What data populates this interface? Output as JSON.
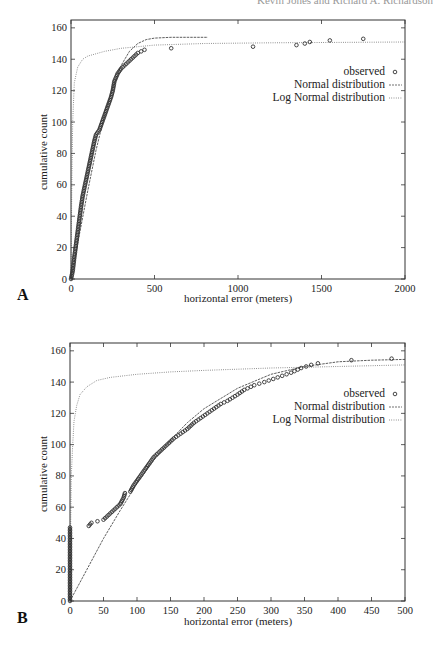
{
  "header": {
    "running_head": "Kevin Jones and Richard A. Richardson"
  },
  "chart_data": [
    {
      "panel": "A",
      "type": "scatter",
      "title": "",
      "xlabel": "horizontal error (meters)",
      "ylabel": "cumulative count",
      "xlim": [
        0,
        2000
      ],
      "ylim": [
        0,
        165
      ],
      "xticks": [
        0,
        500,
        1000,
        1500,
        2000
      ],
      "yticks": [
        0,
        20,
        40,
        60,
        80,
        100,
        120,
        140,
        160
      ],
      "grid": false,
      "legend_position": "upper right",
      "legend": [
        "observed",
        "Normal distribution",
        "Log Normal distribution"
      ],
      "series": [
        {
          "name": "observed",
          "style": "open circles",
          "points": [
            [
              0,
              0
            ],
            [
              10,
              5
            ],
            [
              20,
              14
            ],
            [
              30,
              22
            ],
            [
              40,
              30
            ],
            [
              50,
              38
            ],
            [
              60,
              46
            ],
            [
              70,
              53
            ],
            [
              80,
              58
            ],
            [
              90,
              63
            ],
            [
              100,
              68
            ],
            [
              110,
              73
            ],
            [
              120,
              78
            ],
            [
              130,
              83
            ],
            [
              140,
              88
            ],
            [
              150,
              92
            ],
            [
              170,
              95
            ],
            [
              180,
              98
            ],
            [
              200,
              104
            ],
            [
              220,
              110
            ],
            [
              240,
              116
            ],
            [
              250,
              120
            ],
            [
              260,
              126
            ],
            [
              280,
              131
            ],
            [
              300,
              134
            ],
            [
              320,
              136
            ],
            [
              350,
              139
            ],
            [
              380,
              142
            ],
            [
              400,
              144
            ],
            [
              420,
              145
            ],
            [
              440,
              146
            ],
            [
              600,
              147
            ],
            [
              1090,
              148
            ],
            [
              1350,
              149
            ],
            [
              1400,
              150
            ],
            [
              1430,
              151
            ],
            [
              1550,
              152
            ],
            [
              1750,
              153
            ]
          ]
        },
        {
          "name": "Normal distribution",
          "style": "dashed line",
          "points": [
            [
              0,
              0
            ],
            [
              50,
              28
            ],
            [
              100,
              56
            ],
            [
              150,
              82
            ],
            [
              200,
              104
            ],
            [
              250,
              122
            ],
            [
              300,
              136
            ],
            [
              350,
              145
            ],
            [
              400,
              150
            ],
            [
              450,
              152.5
            ],
            [
              500,
              153.5
            ],
            [
              600,
              154
            ],
            [
              700,
              154
            ],
            [
              820,
              154
            ]
          ]
        },
        {
          "name": "Log Normal distribution",
          "style": "dotted line",
          "points": [
            [
              0,
              0
            ],
            [
              5,
              60
            ],
            [
              10,
              100
            ],
            [
              20,
              125
            ],
            [
              40,
              135
            ],
            [
              70,
              140
            ],
            [
              100,
              142
            ],
            [
              200,
              145
            ],
            [
              300,
              147
            ],
            [
              500,
              149
            ],
            [
              800,
              150
            ],
            [
              1200,
              150.5
            ],
            [
              2000,
              151
            ]
          ]
        }
      ]
    },
    {
      "panel": "B",
      "type": "scatter",
      "title": "",
      "xlabel": "horizontal error (meters)",
      "ylabel": "cumulative count",
      "xlim": [
        0,
        500
      ],
      "ylim": [
        0,
        165
      ],
      "xticks": [
        0,
        50,
        100,
        150,
        200,
        250,
        300,
        350,
        400,
        450,
        500
      ],
      "yticks": [
        0,
        20,
        40,
        60,
        80,
        100,
        120,
        140,
        160
      ],
      "grid": false,
      "legend_position": "upper right",
      "legend": [
        "observed",
        "Normal distribution",
        "Log Normal distribution"
      ],
      "series": [
        {
          "name": "observed",
          "style": "open circles",
          "points": [
            [
              0,
              0
            ],
            [
              0,
              5
            ],
            [
              0,
              10
            ],
            [
              0,
              15
            ],
            [
              0,
              20
            ],
            [
              0,
              25
            ],
            [
              0,
              30
            ],
            [
              0,
              35
            ],
            [
              0,
              40
            ],
            [
              0,
              45
            ],
            [
              0,
              47
            ],
            [
              28,
              48
            ],
            [
              32,
              50
            ],
            [
              50,
              52
            ],
            [
              55,
              54
            ],
            [
              60,
              56
            ],
            [
              65,
              58
            ],
            [
              70,
              60
            ],
            [
              75,
              62
            ],
            [
              80,
              66
            ],
            [
              82,
              69
            ],
            [
              90,
              70
            ],
            [
              95,
              74
            ],
            [
              100,
              77
            ],
            [
              105,
              80
            ],
            [
              110,
              83
            ],
            [
              115,
              86
            ],
            [
              120,
              89
            ],
            [
              125,
              92
            ],
            [
              135,
              96
            ],
            [
              145,
              100
            ],
            [
              155,
              104
            ],
            [
              165,
              107
            ],
            [
              175,
              110
            ],
            [
              185,
              114
            ],
            [
              195,
              117
            ],
            [
              205,
              120
            ],
            [
              215,
              123
            ],
            [
              225,
              126
            ],
            [
              235,
              128
            ],
            [
              250,
              132
            ],
            [
              260,
              135
            ],
            [
              275,
              138
            ],
            [
              290,
              140
            ],
            [
              310,
              143
            ],
            [
              330,
              146
            ],
            [
              345,
              149
            ],
            [
              360,
              151
            ],
            [
              370,
              152
            ],
            [
              420,
              154
            ],
            [
              480,
              155
            ]
          ]
        },
        {
          "name": "Normal distribution",
          "style": "dashed line",
          "points": [
            [
              0,
              0
            ],
            [
              25,
              20
            ],
            [
              50,
              40
            ],
            [
              75,
              58
            ],
            [
              100,
              75
            ],
            [
              125,
              90
            ],
            [
              150,
              103
            ],
            [
              175,
              114
            ],
            [
              200,
              123
            ],
            [
              250,
              136
            ],
            [
              300,
              145
            ],
            [
              350,
              150
            ],
            [
              400,
              153
            ],
            [
              450,
              154
            ],
            [
              500,
              154.5
            ]
          ]
        },
        {
          "name": "Log Normal distribution",
          "style": "dotted line",
          "points": [
            [
              0,
              0
            ],
            [
              1,
              50
            ],
            [
              2,
              80
            ],
            [
              4,
              100
            ],
            [
              6,
              115
            ],
            [
              10,
              125
            ],
            [
              15,
              132
            ],
            [
              25,
              137
            ],
            [
              40,
              141
            ],
            [
              60,
              143
            ],
            [
              100,
              145
            ],
            [
              150,
              146.5
            ],
            [
              200,
              147.5
            ],
            [
              300,
              149
            ],
            [
              400,
              150
            ],
            [
              500,
              151
            ]
          ]
        }
      ]
    }
  ],
  "panels": {
    "A": {
      "letter": "A",
      "xlabel": "horizontal error (meters)",
      "ylabel": "cumulative count",
      "xtick_labels": [
        "0",
        "500",
        "1000",
        "1500",
        "2000"
      ],
      "ytick_labels": [
        "0",
        "20",
        "40",
        "60",
        "80",
        "100",
        "120",
        "140",
        "160"
      ],
      "legend": {
        "observed": "observed",
        "normal": "Normal distribution",
        "lognormal": "Log Normal distribution"
      }
    },
    "B": {
      "letter": "B",
      "xlabel": "horizontal error (meters)",
      "ylabel": "cumulative count",
      "xtick_labels": [
        "0",
        "50",
        "100",
        "150",
        "200",
        "250",
        "300",
        "350",
        "400",
        "450",
        "500"
      ],
      "ytick_labels": [
        "0",
        "20",
        "40",
        "60",
        "80",
        "100",
        "120",
        "140",
        "160"
      ],
      "legend": {
        "observed": "observed",
        "normal": "Normal distribution",
        "lognormal": "Log Normal distribution"
      }
    }
  },
  "colors": {
    "ink": "#222222",
    "frame": "#333333",
    "background": "#ffffff"
  }
}
